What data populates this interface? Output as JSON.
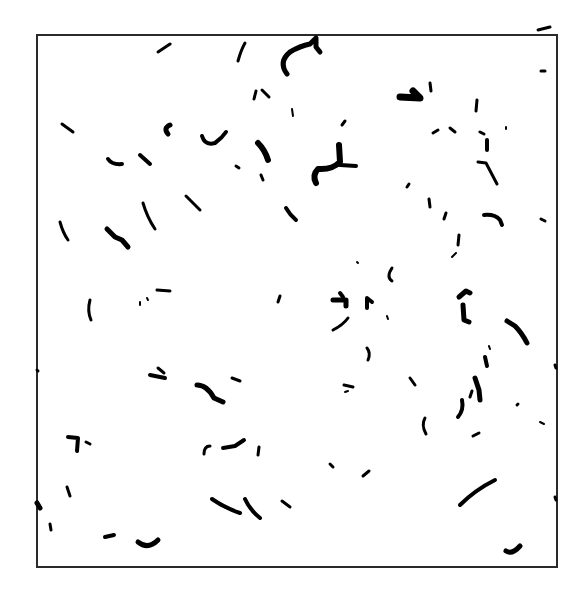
{
  "figure": {
    "frame": {
      "x": 37,
      "y": 35,
      "w": 518,
      "h": 530,
      "stroke": "#2a2a2a"
    },
    "ink_color": "#000000",
    "background": "#ffffff",
    "strokes": [
      {
        "d": "M158 52 L170 44",
        "w": 3
      },
      {
        "d": "M238 61 Q241 50 245 43",
        "w": 3
      },
      {
        "d": "M287 74 Q278 62 290 52 Q300 46 310 44 L316 38 L316 47 L320 52",
        "w": 5
      },
      {
        "d": "M254 99 L256 91",
        "w": 3
      },
      {
        "d": "M262 90 L269 97",
        "w": 3
      },
      {
        "d": "M292 109 L293 116",
        "w": 2
      },
      {
        "d": "M62 124 L73 132",
        "w": 3
      },
      {
        "d": "M168 134 Q163 128 170 125",
        "w": 5
      },
      {
        "d": "M202 136 Q205 146 215 143 Q222 138 226 132",
        "w": 4
      },
      {
        "d": "M258 143 Q265 150 268 160",
        "w": 6
      },
      {
        "d": "M108 159 Q112 165 122 164",
        "w": 4
      },
      {
        "d": "M140 155 L150 164",
        "w": 4
      },
      {
        "d": "M236 166 L239 168",
        "w": 3
      },
      {
        "d": "M261 175 L263 180",
        "w": 3
      },
      {
        "d": "M339 145 L340 162 Q332 170 318 169 Q312 175 316 183",
        "w": 6
      },
      {
        "d": "M340 165 L356 166",
        "w": 4
      },
      {
        "d": "M342 125 L345 121",
        "w": 3
      },
      {
        "d": "M186 196 L200 210",
        "w": 3
      },
      {
        "d": "M143 203 Q147 217 155 229",
        "w": 3
      },
      {
        "d": "M286 208 Q290 215 296 220",
        "w": 4
      },
      {
        "d": "M60 222 Q63 233 68 240",
        "w": 3
      },
      {
        "d": "M107 229 L115 237 L122 240 L128 247",
        "w": 5
      },
      {
        "d": "M400 97 L420 98 L413 91",
        "w": 7
      },
      {
        "d": "M430 83 L431 91",
        "w": 3
      },
      {
        "d": "M477 100 L476 111",
        "w": 3
      },
      {
        "d": "M433 133 L438 130",
        "w": 3
      },
      {
        "d": "M450 128 L455 132",
        "w": 3
      },
      {
        "d": "M480 132 L484 134",
        "w": 3
      },
      {
        "d": "M487 140 L487 150",
        "w": 4
      },
      {
        "d": "M478 162 L486 163 L497 184",
        "w": 3
      },
      {
        "d": "M541 71 L545 71",
        "w": 3
      },
      {
        "d": "M538 30 L550 27",
        "w": 3
      },
      {
        "d": "M506 127 L506 129",
        "w": 2
      },
      {
        "d": "M407 187 L409 184",
        "w": 3
      },
      {
        "d": "M429 199 L430 207",
        "w": 3
      },
      {
        "d": "M444 219 L446 213",
        "w": 3
      },
      {
        "d": "M459 235 L458 245",
        "w": 3
      },
      {
        "d": "M456 253 L452 257",
        "w": 2
      },
      {
        "d": "M484 215 Q495 214 500 220 L502 225",
        "w": 4
      },
      {
        "d": "M541 219 L545 221",
        "w": 3
      },
      {
        "d": "M357 262 L358 263",
        "w": 2
      },
      {
        "d": "M392 268 Q386 277 392 281",
        "w": 3
      },
      {
        "d": "M90 300 Q87 311 91 320",
        "w": 3
      },
      {
        "d": "M157 290 L170 291",
        "w": 3
      },
      {
        "d": "M140 302 L140 305",
        "w": 2
      },
      {
        "d": "M147 298 L148 300",
        "w": 2
      },
      {
        "d": "M278 302 L280 296",
        "w": 3
      },
      {
        "d": "M333 300 L346 300 L346 306",
        "w": 5
      },
      {
        "d": "M340 293 L343 297",
        "w": 4
      },
      {
        "d": "M367 308 L367 298 L372 302",
        "w": 4
      },
      {
        "d": "M387 316 L388 319",
        "w": 2
      },
      {
        "d": "M333 330 Q343 325 348 318",
        "w": 3
      },
      {
        "d": "M367 348 Q371 353 368 360",
        "w": 3
      },
      {
        "d": "M459 297 L466 291 L470 293",
        "w": 5
      },
      {
        "d": "M463 305 L464 320 L469 322",
        "w": 5
      },
      {
        "d": "M507 321 L515 326 Q522 333 527 343",
        "w": 5
      },
      {
        "d": "M489 346 L490 349",
        "w": 2
      },
      {
        "d": "M485 357 L487 366",
        "w": 4
      },
      {
        "d": "M158 368 L164 373",
        "w": 3
      },
      {
        "d": "M150 375 L165 378",
        "w": 4
      },
      {
        "d": "M197 385 Q207 385 214 398 L223 402",
        "w": 5
      },
      {
        "d": "M232 378 L240 381",
        "w": 3
      },
      {
        "d": "M344 385 L353 387",
        "w": 3
      },
      {
        "d": "M345 392 L348 391",
        "w": 2
      },
      {
        "d": "M410 378 L415 385",
        "w": 3
      },
      {
        "d": "M475 378 L479 390 L480 400",
        "w": 5
      },
      {
        "d": "M470 397 L472 391",
        "w": 3
      },
      {
        "d": "M462 400 Q464 410 458 417",
        "w": 4
      },
      {
        "d": "M517 405 L518 404",
        "w": 3
      },
      {
        "d": "M425 418 Q421 425 426 434",
        "w": 3
      },
      {
        "d": "M473 436 L479 433",
        "w": 3
      },
      {
        "d": "M540 422 L544 424",
        "w": 2
      },
      {
        "d": "M68 437 L78 438 L77 451",
        "w": 4
      },
      {
        "d": "M86 442 L90 444",
        "w": 3
      },
      {
        "d": "M204 454 Q204 446 210 446",
        "w": 3
      },
      {
        "d": "M223 448 L235 446 L244 440",
        "w": 4
      },
      {
        "d": "M259 447 L258 455",
        "w": 3
      },
      {
        "d": "M330 464 L333 467",
        "w": 3
      },
      {
        "d": "M363 476 L369 471",
        "w": 3
      },
      {
        "d": "M67 487 L70 496",
        "w": 3
      },
      {
        "d": "M212 499 Q225 508 240 513",
        "w": 4
      },
      {
        "d": "M245 499 Q250 510 260 518",
        "w": 4
      },
      {
        "d": "M282 501 L290 507",
        "w": 3
      },
      {
        "d": "M460 505 Q475 490 495 480",
        "w": 4
      },
      {
        "d": "M50 524 L51 530",
        "w": 3
      },
      {
        "d": "M105 537 L114 535",
        "w": 4
      },
      {
        "d": "M138 542 Q148 550 158 540",
        "w": 5
      },
      {
        "d": "M506 551 Q512 555 520 546",
        "w": 5
      },
      {
        "d": "M37 503 L40 508",
        "w": 5
      },
      {
        "d": "M37 370 L38 371",
        "w": 3
      },
      {
        "d": "M555 365 L556 368",
        "w": 3
      },
      {
        "d": "M555 497 L556 500",
        "w": 3
      }
    ]
  }
}
